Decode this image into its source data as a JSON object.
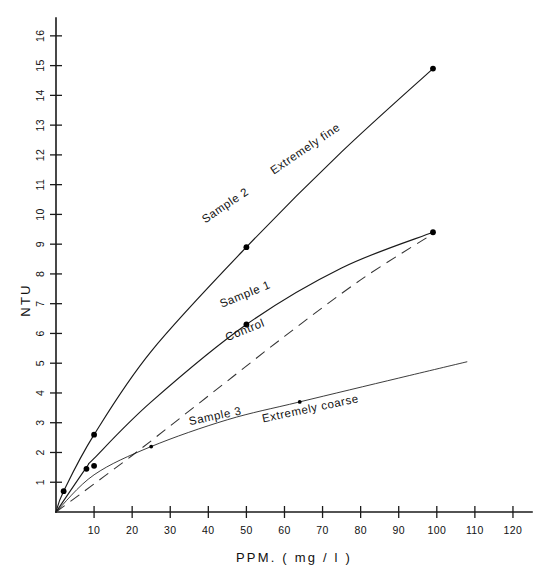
{
  "chart_data": {
    "type": "line",
    "title": "",
    "xlabel": "PPM. ( mg / l )",
    "ylabel": "NTU",
    "xlim": [
      0,
      125
    ],
    "ylim": [
      0,
      16.6
    ],
    "grid": false,
    "legend_position": "inline-curve-labels",
    "xticks": [
      10,
      20,
      30,
      40,
      50,
      60,
      70,
      80,
      90,
      100,
      110,
      120
    ],
    "yticks": [
      1,
      2,
      3,
      4,
      5,
      6,
      7,
      8,
      9,
      10,
      11,
      12,
      13,
      14,
      15,
      16
    ],
    "xtick_labels": [
      "10",
      "20",
      "30",
      "40",
      "50",
      "60",
      "70",
      "80",
      "90",
      "100",
      "110",
      "120"
    ],
    "ytick_labels": [
      "1",
      "2",
      "3",
      "4",
      "5",
      "6",
      "7",
      "8",
      "9",
      "10",
      "11",
      "12",
      "13",
      "14",
      "15",
      "16"
    ],
    "series": [
      {
        "name": "Sample 2",
        "annotation": "Extremely fine",
        "style": "solid",
        "markers": true,
        "points": [
          {
            "x": 0,
            "y": 0.0
          },
          {
            "x": 2,
            "y": 0.7
          },
          {
            "x": 10,
            "y": 2.6
          },
          {
            "x": 25,
            "y": 5.4
          },
          {
            "x": 50,
            "y": 8.9
          },
          {
            "x": 75,
            "y": 12.1
          },
          {
            "x": 99,
            "y": 14.9
          }
        ],
        "marker_points": [
          {
            "x": 2,
            "y": 0.7
          },
          {
            "x": 10,
            "y": 2.6
          },
          {
            "x": 50,
            "y": 8.9
          },
          {
            "x": 99,
            "y": 14.9
          }
        ]
      },
      {
        "name": "Sample 1",
        "annotation": "",
        "style": "solid",
        "markers": true,
        "points": [
          {
            "x": 0,
            "y": 0.0
          },
          {
            "x": 8,
            "y": 1.5
          },
          {
            "x": 10,
            "y": 1.8
          },
          {
            "x": 25,
            "y": 3.7
          },
          {
            "x": 50,
            "y": 6.3
          },
          {
            "x": 75,
            "y": 8.2
          },
          {
            "x": 99,
            "y": 9.4
          }
        ],
        "marker_points": [
          {
            "x": 8,
            "y": 1.45
          },
          {
            "x": 10,
            "y": 1.55
          },
          {
            "x": 50,
            "y": 6.3
          },
          {
            "x": 99,
            "y": 9.4
          }
        ]
      },
      {
        "name": "Control",
        "annotation": "",
        "style": "dashed",
        "markers": false,
        "points": [
          {
            "x": 0,
            "y": 0.0
          },
          {
            "x": 20,
            "y": 1.9
          },
          {
            "x": 40,
            "y": 3.9
          },
          {
            "x": 60,
            "y": 5.9
          },
          {
            "x": 80,
            "y": 7.8
          },
          {
            "x": 99,
            "y": 9.35
          }
        ],
        "marker_points": []
      },
      {
        "name": "Sample 3",
        "annotation": "Extremely coarse",
        "style": "solid-thin",
        "markers": true,
        "points": [
          {
            "x": 0,
            "y": 0.0
          },
          {
            "x": 10,
            "y": 1.25
          },
          {
            "x": 25,
            "y": 2.2
          },
          {
            "x": 45,
            "y": 3.1
          },
          {
            "x": 64,
            "y": 3.7
          },
          {
            "x": 90,
            "y": 4.5
          },
          {
            "x": 108,
            "y": 5.05
          }
        ],
        "marker_points": [
          {
            "x": 25,
            "y": 2.2
          },
          {
            "x": 64,
            "y": 3.7
          }
        ]
      }
    ],
    "annotations": [
      {
        "text": "Sample 2",
        "x": 45,
        "y": 10.2,
        "rotation": -34
      },
      {
        "text": "Extremely fine",
        "x": 66,
        "y": 12.1,
        "rotation": -34
      },
      {
        "text": "Sample 1",
        "x": 50,
        "y": 7.2,
        "rotation": -22
      },
      {
        "text": "Control",
        "x": 50,
        "y": 6.0,
        "rotation": -22
      },
      {
        "text": "Sample 3",
        "x": 42,
        "y": 3.1,
        "rotation": -12
      },
      {
        "text": "Extremely coarse",
        "x": 67,
        "y": 3.35,
        "rotation": -12
      }
    ]
  },
  "axes": {
    "y_title": "NTU",
    "x_title": "PPM. ( mg / l )"
  }
}
